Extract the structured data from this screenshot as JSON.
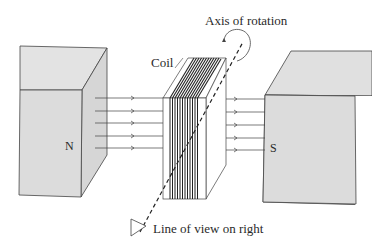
{
  "diagram": {
    "labels": {
      "axis": "Axis of rotation",
      "coil": "Coil",
      "north": "N",
      "south": "S",
      "line_of_view": "Line of view on right"
    },
    "components": [
      {
        "name": "north-magnet",
        "label": "N"
      },
      {
        "name": "south-magnet",
        "label": "S"
      },
      {
        "name": "coil",
        "label": "Coil"
      },
      {
        "name": "field-lines",
        "count": 5,
        "direction": "N to S"
      },
      {
        "name": "rotation-axis",
        "style": "dashed"
      }
    ],
    "colors": {
      "magnet_fill": "#dcdcdc",
      "magnet_top": "#e2e2e2",
      "magnet_side": "#d4d4d4",
      "stroke": "#3a3a3a"
    }
  }
}
